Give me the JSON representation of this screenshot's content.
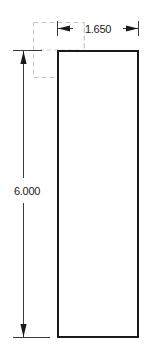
{
  "drawing": {
    "title": "Rectangular Part Dimensioned Drawing",
    "background_color": "#ffffff",
    "outline_color": "#1a1a1a",
    "construction_color": "#c9c9c9",
    "dimension_color": "#3a3a3a",
    "view_width_px": 146,
    "view_height_px": 355
  },
  "part": {
    "name": "rectangle-profile",
    "shape": "rectangle",
    "width_value": "1.650",
    "height_value": "6.000",
    "units": "in"
  },
  "dimensions": {
    "width": {
      "label": "1.650",
      "orientation": "horizontal",
      "position": "top",
      "arrow_style": "filled-inward"
    },
    "height": {
      "label": "6.000",
      "orientation": "vertical",
      "position": "left",
      "arrow_style": "filled-inward"
    }
  },
  "construction": {
    "hidden_box_label": "construction-reference-box",
    "line_style": "dashed"
  }
}
